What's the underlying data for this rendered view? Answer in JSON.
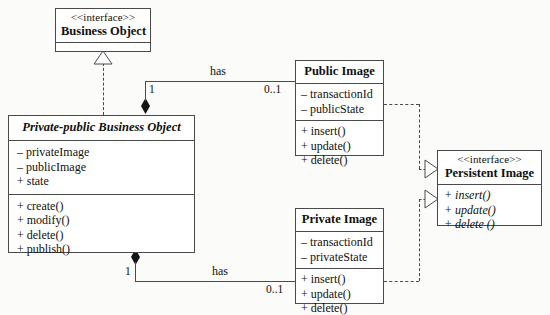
{
  "diagram": {
    "colors": {
      "line": "#4a4a4a",
      "fill": "#ffffff",
      "background": "#fbfbfa",
      "diamond": "#151515"
    }
  },
  "classes": {
    "business_object": {
      "stereotype": "<<interface>>",
      "name": "Business Object",
      "attributes": [],
      "operations": []
    },
    "private_public_business_object": {
      "stereotype": "",
      "name": "Private-public Business Object",
      "attributes": [
        "– privateImage",
        "– publicImage",
        "+ state"
      ],
      "operations": [
        "+ create()",
        "+ modify()",
        "+ delete()",
        "+ publish()"
      ]
    },
    "public_image": {
      "stereotype": "",
      "name": "Public Image",
      "attributes": [
        "– transactionId",
        "– publicState"
      ],
      "operations": [
        "+ insert()",
        "+ update()",
        "+ delete()"
      ]
    },
    "private_image": {
      "stereotype": "",
      "name": "Private Image",
      "attributes": [
        "– transactionId",
        "– privateState"
      ],
      "operations": [
        "+ insert()",
        "+ update()",
        "+ delete()"
      ]
    },
    "persistent_image": {
      "stereotype": "<<interface>>",
      "name": "Persistent Image",
      "attributes": [],
      "operations": [
        "+ insert()",
        "+ update()",
        "+ delete ()"
      ]
    }
  },
  "associations": {
    "public_has": {
      "label": "has",
      "source_multiplicity": "1",
      "target_multiplicity": "0..1"
    },
    "private_has": {
      "label": "has",
      "source_multiplicity": "1",
      "target_multiplicity": "0..1"
    }
  }
}
